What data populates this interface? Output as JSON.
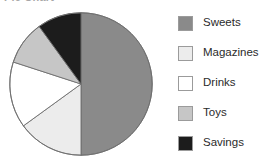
{
  "chart_data": {
    "type": "pie",
    "title": "Pie Chart",
    "xlabel": "",
    "ylabel": "",
    "legend_position": "right",
    "grid": false,
    "categories": [
      "Sweets",
      "Magazines",
      "Drinks",
      "Toys",
      "Savings"
    ],
    "values": [
      50,
      15,
      15,
      10,
      10
    ],
    "units": "percent",
    "colors": [
      "#8a8a8a",
      "#ececec",
      "#ffffff",
      "#c6c6c6",
      "#1c1c1c"
    ],
    "slices": [
      {
        "label": "Sweets",
        "value": 50,
        "color": "#8a8a8a",
        "start_angle": 0,
        "end_angle": 180
      },
      {
        "label": "Magazines",
        "value": 15,
        "color": "#ececec",
        "start_angle": 180,
        "end_angle": 234
      },
      {
        "label": "Drinks",
        "value": 15,
        "color": "#ffffff",
        "start_angle": 234,
        "end_angle": 288
      },
      {
        "label": "Toys",
        "value": 10,
        "color": "#c6c6c6",
        "start_angle": 288,
        "end_angle": 324
      },
      {
        "label": "Savings",
        "value": 10,
        "color": "#1c1c1c",
        "start_angle": 324,
        "end_angle": 360
      }
    ],
    "stroke": "#6e6e6e"
  },
  "legend": {
    "items": [
      {
        "label": "Sweets",
        "color": "#8a8a8a"
      },
      {
        "label": "Magazines",
        "color": "#ececec"
      },
      {
        "label": "Drinks",
        "color": "#ffffff"
      },
      {
        "label": "Toys",
        "color": "#c6c6c6"
      },
      {
        "label": "Savings",
        "color": "#1c1c1c"
      }
    ]
  }
}
